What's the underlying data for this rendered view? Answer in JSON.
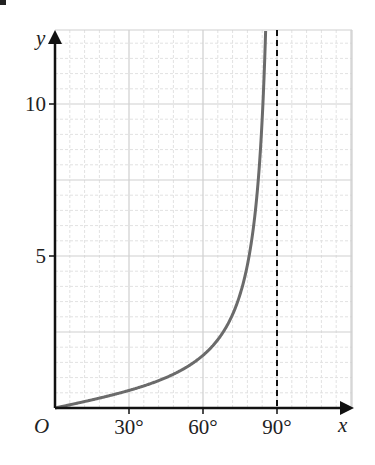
{
  "chart_data": {
    "type": "line",
    "title": "",
    "function": "y = tan x",
    "xlabel": "x",
    "ylabel": "y",
    "origin_label": "O",
    "x_unit": "degrees",
    "xlim": [
      0,
      120
    ],
    "ylim": [
      0,
      12.4
    ],
    "x_ticks": [
      {
        "value": 30,
        "label": "30°"
      },
      {
        "value": 60,
        "label": "60°"
      },
      {
        "value": 90,
        "label": "90°"
      }
    ],
    "y_ticks": [
      {
        "value": 5,
        "label": "5"
      },
      {
        "value": 10,
        "label": "10"
      }
    ],
    "grid": {
      "major_x_step": 30,
      "minor_x_step": 6,
      "major_y_step": 2.5,
      "minor_y_step": 0.5,
      "on": true
    },
    "asymptote": {
      "x": 90,
      "style": "dashed"
    },
    "series": [
      {
        "name": "tan x",
        "x": [
          0,
          10,
          20,
          30,
          40,
          45,
          50,
          55,
          60,
          65,
          70,
          75,
          80,
          82,
          84,
          85.4
        ],
        "y": [
          0,
          0.18,
          0.36,
          0.58,
          0.84,
          1.0,
          1.19,
          1.43,
          1.73,
          2.14,
          2.75,
          3.73,
          5.67,
          7.12,
          9.51,
          12.4
        ]
      }
    ],
    "colors": {
      "curve": "#6b6b6b",
      "axes": "#111111",
      "grid_major": "#cfcfcf",
      "grid_minor": "#e2e2e2",
      "asymptote": "#111111"
    }
  }
}
